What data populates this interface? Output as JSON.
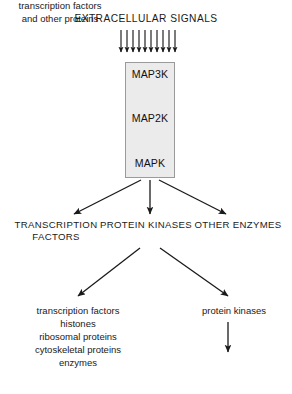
{
  "diagram": {
    "title": "EXTRACELLULAR SIGNALS",
    "background_color": "#ffffff",
    "line_color": "#1a1a1a",
    "box_fill_color": "#ebebeb",
    "box_border_color": "#9a9a9a",
    "signal_arrow_count": 10
  },
  "cascade": {
    "steps": [
      {
        "label": "MAP3K"
      },
      {
        "label": "MAP2K"
      },
      {
        "label": "MAPK"
      }
    ]
  },
  "targets": [
    {
      "label": "TRANSCRIPTION\nFACTORS"
    },
    {
      "label": "PROTEIN\nKINASES"
    },
    {
      "label": "OTHER\nENZYMES"
    }
  ],
  "substrates": {
    "left": [
      "transcription factors",
      "histones",
      "ribosomal proteins",
      "cytoskeletal proteins",
      "enzymes"
    ],
    "right": [
      "protein kinases"
    ],
    "right_downstream": [
      "transcription factors",
      "and other proteins"
    ]
  }
}
